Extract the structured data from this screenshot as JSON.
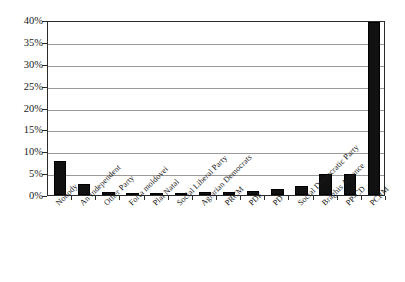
{
  "top_bleed": {
    "fragments": [
      "·",
      "·",
      "··",
      "·",
      "·",
      "·"
    ]
  },
  "chart_data": {
    "type": "bar",
    "title": "",
    "subtitle": "",
    "xlabel": "",
    "ylabel": "",
    "categories": [
      "Nobody",
      "An Independent",
      "Other Party",
      "Forta moldovei",
      "Plai Natal",
      "Social Liberal Party",
      "Agrarian Democrats",
      "PRCM",
      "PDF",
      "PD",
      "Social Democratic Party",
      "Braghis Alliance",
      "PP-CD",
      "PCRM"
    ],
    "values": [
      7.8,
      2.6,
      0.7,
      0.15,
      0.3,
      0.4,
      0.6,
      0.8,
      1.0,
      1.3,
      2.0,
      4.9,
      4.8,
      39.5
    ],
    "ylim": [
      0,
      40
    ],
    "yticks": [
      0,
      5,
      10,
      15,
      20,
      25,
      30,
      35,
      40
    ],
    "ytick_labels": [
      "0%",
      "5%",
      "10%",
      "15%",
      "20%",
      "25%",
      "30%",
      "35%",
      "40%"
    ],
    "grid": true,
    "grid_axis": "y",
    "legend": false,
    "bar_color": "#111111",
    "axis_color": "#2b2b2b",
    "grid_color": "#9a9a9a",
    "background": "#ffffff"
  }
}
